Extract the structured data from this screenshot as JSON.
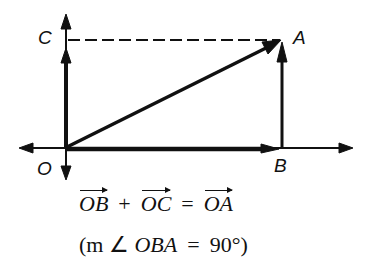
{
  "diagram": {
    "points": {
      "O": {
        "label": "O",
        "x": 66,
        "y": 148
      },
      "A": {
        "label": "A",
        "x": 281,
        "y": 40
      },
      "B": {
        "label": "B",
        "x": 281,
        "y": 148
      },
      "C": {
        "label": "C",
        "x": 66,
        "y": 40
      }
    },
    "vectors": [
      "OB",
      "OC",
      "OA",
      "BA"
    ],
    "dashed_segments": [
      "CA"
    ],
    "axes": {
      "horizontal": true,
      "vertical": true
    }
  },
  "equation": {
    "term1": "OB",
    "plus": "+",
    "term2": "OC",
    "equals": "=",
    "result": "OA"
  },
  "condition": {
    "open": "(m ∠",
    "angle": "OBA",
    "equals": "=",
    "value": "90°)"
  }
}
